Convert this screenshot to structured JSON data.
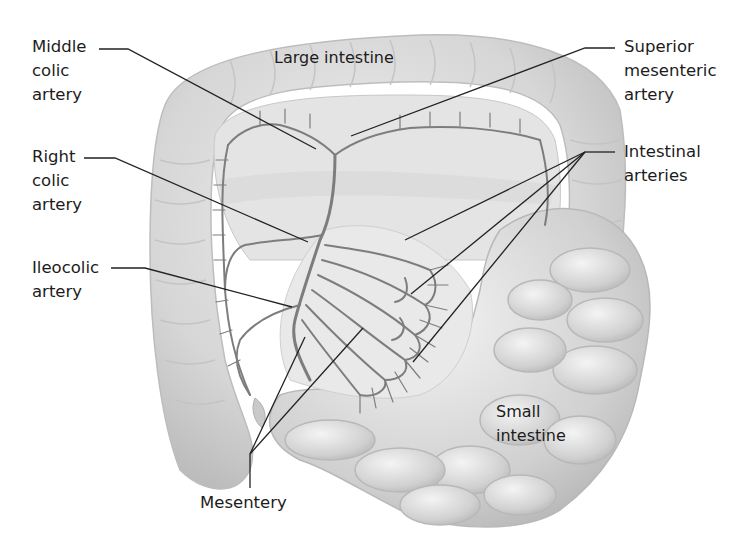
{
  "diagram": {
    "labels": {
      "middle_colic_artery": "Middle\ncolic\nartery",
      "right_colic_artery": "Right\ncolic\nartery",
      "ileocolic_artery": "Ileocolic\nartery",
      "large_intestine": "Large intestine",
      "superior_mesenteric_artery": "Superior\nmesenteric\nartery",
      "intestinal_arteries": "Intestinal\narteries",
      "small_intestine": "Small\nintestine",
      "mesentery": "Mesentery"
    },
    "colors": {
      "background": "#ffffff",
      "tissue_light": "#e6e6e6",
      "tissue_mid": "#cfcfcf",
      "tissue_dark": "#b5b5b5",
      "vessel": "#7a7a7a",
      "leader_line": "#222222",
      "text": "#1c1c1c"
    }
  }
}
